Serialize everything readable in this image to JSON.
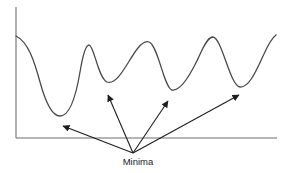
{
  "diagram": {
    "label": "Minima",
    "colors": {
      "curve": "#4a4a4a",
      "axes": "#6e6e6e",
      "arrows": "#1e1e1e",
      "text": "#1a1a1a",
      "background": "#ffffff"
    },
    "axes": {
      "y_axis": {
        "x": 16,
        "y_top": 7,
        "y_bottom": 138
      },
      "x_axis": {
        "y": 138,
        "x_left": 16,
        "x_right": 277
      }
    },
    "curve_keypoints": [
      {
        "kind": "start",
        "x": 16,
        "y": 36
      },
      {
        "kind": "minimum",
        "x": 60,
        "y": 116
      },
      {
        "kind": "maximum",
        "x": 88,
        "y": 45
      },
      {
        "kind": "minimum",
        "x": 107,
        "y": 82
      },
      {
        "kind": "maximum",
        "x": 148,
        "y": 42
      },
      {
        "kind": "minimum",
        "x": 172,
        "y": 90
      },
      {
        "kind": "maximum",
        "x": 213,
        "y": 37
      },
      {
        "kind": "minimum",
        "x": 240,
        "y": 87
      },
      {
        "kind": "end",
        "x": 276,
        "y": 35
      }
    ],
    "arrows": {
      "origin": {
        "x": 133,
        "y": 153
      },
      "targets": [
        {
          "name": "minimum-1",
          "x": 63,
          "y": 126
        },
        {
          "name": "minimum-2",
          "x": 108,
          "y": 95
        },
        {
          "name": "minimum-3",
          "x": 168,
          "y": 101
        },
        {
          "name": "minimum-4",
          "x": 239,
          "y": 95
        }
      ]
    }
  }
}
